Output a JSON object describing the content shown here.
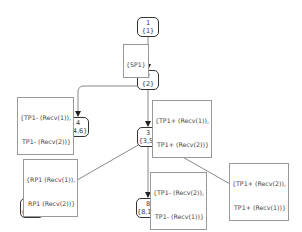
{
  "nodes": [
    {
      "id": "1",
      "line1": "1",
      "line2": "{1}"
    },
    {
      "id": "2",
      "line1": "2",
      "line2": "{2}"
    },
    {
      "id": "4",
      "line1": "4",
      "line2": "{4,6}"
    },
    {
      "id": "3",
      "line1": "3",
      "line2": "{3,5}"
    },
    {
      "id": "9",
      "line1": "9",
      "line2": "{9,11}"
    },
    {
      "id": "8",
      "line1": "8",
      "line2": "{8,10}"
    },
    {
      "id": "7",
      "line1": "7",
      "line2": "{7}"
    }
  ],
  "edges": [
    {
      "from": "1",
      "to": "2",
      "label": [
        "{SP1}"
      ]
    },
    {
      "from": "2",
      "to": "4",
      "label": [
        "{TP1- (Recv(1)),",
        "TP1- (Recv(2))}"
      ]
    },
    {
      "from": "2",
      "to": "3",
      "label": [
        "{TP1+ (Recv(1)),",
        "TP1+ (Recv(2))}"
      ]
    },
    {
      "from": "3",
      "to": "9",
      "label": [
        "{RP1 (Recv(1)),",
        "RP1 (Recv(2))}"
      ]
    },
    {
      "from": "3",
      "to": "8",
      "label": [
        "{TP1- (Recv(2)),",
        "TP1- (Recv(1))}"
      ]
    },
    {
      "from": "3",
      "to": "7",
      "label": [
        "{TP1+ (Recv(2)),",
        "TP1+ (Recv(1))}"
      ]
    }
  ],
  "colors": {
    "edge": "#888888",
    "node_border": "#333333",
    "label_border": "#999999"
  }
}
